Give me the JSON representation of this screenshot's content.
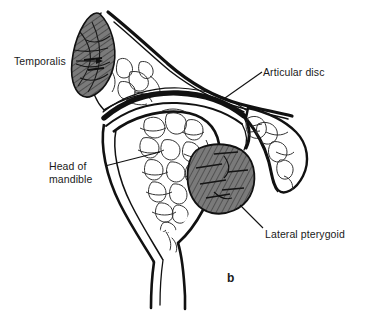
{
  "figure": {
    "panel_label": "b"
  },
  "labels": [
    {
      "id": "temporalis",
      "text": "Temporalis",
      "structure": "temporalis-muscle"
    },
    {
      "id": "articular_disc",
      "text": "Articular disc",
      "structure": "articular-disc"
    },
    {
      "id": "head_of_mandible",
      "line1": "Head of",
      "line2": "mandible",
      "structure": "mandibular-condyle"
    },
    {
      "id": "lateral_pterygoid",
      "text": "Lateral pterygoid",
      "structure": "lateral-pterygoid-muscle"
    }
  ],
  "colors": {
    "ink": "#111111",
    "muscle_fill": "#7a7a7a",
    "muscle_hatch": "#2b2b2b",
    "bone_line": "#333333",
    "background": "#ffffff",
    "text": "#1a1a1a"
  }
}
